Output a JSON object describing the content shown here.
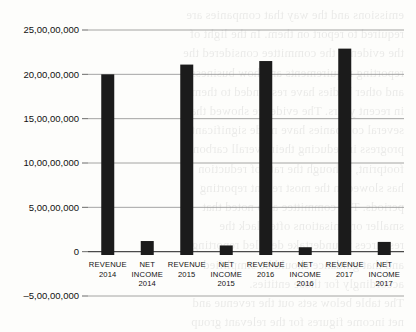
{
  "chart_data": {
    "type": "bar",
    "title": "",
    "xlabel": "",
    "ylabel": "",
    "categories": [
      "REVENUE 2014",
      "NET INCOME 2014",
      "REVENUE 2015",
      "NET INCOME 2015",
      "REVENUE 2016",
      "NET INCOME 2016",
      "REVENUE 2017",
      "NET INCOME 2017"
    ],
    "category_lines": [
      [
        "REVENUE",
        "2014"
      ],
      [
        "NET",
        "INCOME",
        "2014"
      ],
      [
        "REVENUE",
        "2015"
      ],
      [
        "NET",
        "INCOME",
        "2015"
      ],
      [
        "REVENUE",
        "2016"
      ],
      [
        "NET",
        "INCOME",
        "2016"
      ],
      [
        "REVENUE",
        "2017"
      ],
      [
        "NET",
        "INCOME",
        "2017"
      ]
    ],
    "values": [
      200000000,
      12000000,
      211000000,
      7000000,
      215000000,
      5000000,
      229000000,
      11000000
    ],
    "ylim": [
      -50000000,
      250000000
    ],
    "ytick_values": [
      250000000,
      200000000,
      150000000,
      100000000,
      50000000,
      0,
      -50000000
    ],
    "ytick_labels": [
      "25,00,00,000",
      "20,00,00,000",
      "15,00,00,000",
      "10,00,00,000",
      "5,00,00,000",
      "0",
      "–5,00,00,000"
    ],
    "grid": true,
    "legend": "none",
    "bar_color": "#1b1b1b",
    "series_name": "Amount (INR)"
  },
  "background_text": {
    "lines": [
      "emissions and the way that companies are",
      "required to report on them. In the light of",
      "the evidence the committee considered the",
      "reporting requirements and how business",
      "and other bodies have responded to them",
      "in recent years. The evidence showed that",
      "several companies have made significant",
      "progress in reducing their overall carbon",
      "footprint, although the rate of reduction",
      "has slowed in the most recent reporting",
      "periods. The committee also noted that",
      "smaller organisations often lack the",
      "resources to undertake detailed reporting",
      "and that guidance should be simplified",
      "accordingly for those entities.",
      "The table below sets out the revenue and",
      "net income figures for the relevant group",
      "of companies over the four year period.",
      "Climate Change",
      "the first part of the chapter we consider"
    ]
  }
}
